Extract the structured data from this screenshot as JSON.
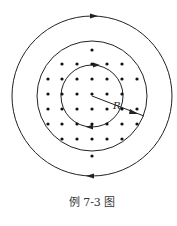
{
  "figure": {
    "caption": "例 7-3 图",
    "radius_label": "R",
    "center": [
      92,
      92
    ],
    "circles": [
      {
        "name": "outer-loop",
        "r": 80,
        "arrows": "top-right, bottom-right"
      },
      {
        "name": "middle-loop",
        "r": 55
      },
      {
        "name": "inner-loop",
        "r": 31,
        "arrows": "top-right, bottom-left"
      }
    ],
    "dot_rows": [
      {
        "y": 48,
        "xs": [
          92
        ]
      },
      {
        "y": 62,
        "xs": [
          62,
          77,
          92,
          107,
          122
        ]
      },
      {
        "y": 77,
        "xs": [
          48,
          62,
          77,
          92,
          107,
          122,
          137
        ]
      },
      {
        "y": 92,
        "xs": [
          48,
          62,
          77,
          92,
          107,
          122
        ]
      },
      {
        "y": 107,
        "xs": [
          48,
          62,
          77,
          92,
          107,
          122,
          137
        ]
      },
      {
        "y": 122,
        "xs": [
          48,
          62,
          77,
          92,
          107,
          122,
          137
        ]
      },
      {
        "y": 137,
        "xs": [
          62,
          77,
          92,
          107,
          122
        ]
      },
      {
        "y": 154,
        "xs": [
          92
        ]
      }
    ],
    "colors": {
      "stroke": "#222222",
      "dot": "#111111"
    }
  }
}
